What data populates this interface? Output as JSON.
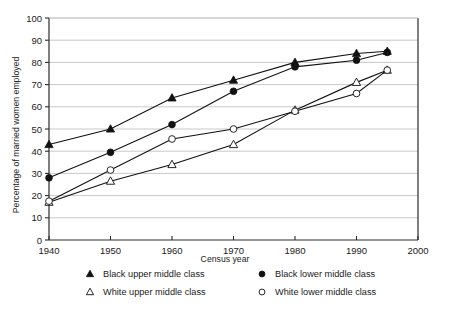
{
  "chart_data": {
    "type": "line",
    "title": "",
    "xlabel": "Census year",
    "ylabel": "Percentage of married women employed",
    "xlim": [
      1940,
      2000
    ],
    "ylim": [
      0,
      100
    ],
    "grid": true,
    "legend_position": "bottom",
    "xticks": [
      "1940",
      "1950",
      "1960",
      "1970",
      "1980",
      "1990",
      "2000"
    ],
    "xtick_values": [
      1940,
      1950,
      1960,
      1970,
      1980,
      1990,
      2000
    ],
    "yticks": [
      "0",
      "10",
      "20",
      "30",
      "40",
      "50",
      "60",
      "70",
      "80",
      "90",
      "100"
    ],
    "ytick_values": [
      0,
      10,
      20,
      30,
      40,
      50,
      60,
      70,
      80,
      90,
      100
    ],
    "x": [
      1940,
      1950,
      1960,
      1970,
      1980,
      1990,
      1995
    ],
    "series": [
      {
        "name": "Black upper middle class",
        "marker": "filled-triangle",
        "values": [
          43,
          50,
          64,
          72,
          80,
          84,
          85
        ]
      },
      {
        "name": "Black lower middle class",
        "marker": "filled-circle",
        "values": [
          28,
          39.5,
          52,
          67,
          78,
          81,
          84.5
        ]
      },
      {
        "name": "White upper middle class",
        "marker": "open-triangle",
        "values": [
          17,
          26.5,
          34,
          43,
          58.5,
          71,
          76.5
        ]
      },
      {
        "name": "White lower middle class",
        "marker": "open-circle",
        "values": [
          17.5,
          31.5,
          45.5,
          50,
          58,
          66,
          76.5
        ]
      }
    ]
  },
  "legend": {
    "entries": [
      {
        "label": "Black upper middle class",
        "marker": "filled-triangle"
      },
      {
        "label": "Black lower middle class",
        "marker": "filled-circle"
      },
      {
        "label": "White upper middle class",
        "marker": "open-triangle"
      },
      {
        "label": "White lower middle class",
        "marker": "open-circle"
      }
    ]
  },
  "colors": {
    "ink": "#111111",
    "grid": "#c9c9c9",
    "axis": "#2b2b2b",
    "background": "#ffffff"
  }
}
